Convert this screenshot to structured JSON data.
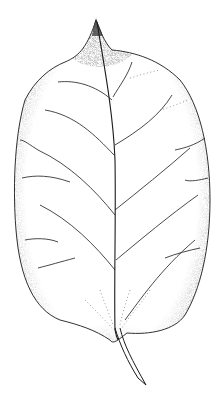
{
  "image": {
    "subject": "leaf",
    "style": "stippled pen-and-ink botanical illustration",
    "background": "#ffffff",
    "ink": "#1a1a1a",
    "width": 223,
    "height": 401
  }
}
